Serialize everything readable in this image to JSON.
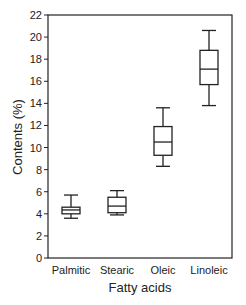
{
  "chart_data": {
    "type": "box",
    "title": "",
    "xlabel": "Fatty acids",
    "ylabel": "Contents (%)",
    "ylim": [
      0,
      22
    ],
    "yticks": [
      0,
      2,
      4,
      6,
      8,
      10,
      12,
      14,
      16,
      18,
      20,
      22
    ],
    "grid": false,
    "legend": null,
    "categories": [
      "Palmitic",
      "Stearic",
      "Oleic",
      "Linoleic"
    ],
    "series": [
      {
        "name": "Palmitic",
        "whisker_low": 3.6,
        "q1": 4.0,
        "median": 4.35,
        "q3": 4.6,
        "whisker_high": 5.7
      },
      {
        "name": "Stearic",
        "whisker_low": 3.9,
        "q1": 4.1,
        "median": 4.7,
        "q3": 5.5,
        "whisker_high": 6.1
      },
      {
        "name": "Oleic",
        "whisker_low": 8.3,
        "q1": 9.3,
        "median": 10.5,
        "q3": 11.9,
        "whisker_high": 13.6
      },
      {
        "name": "Linoleic",
        "whisker_low": 13.8,
        "q1": 15.7,
        "median": 17.1,
        "q3": 18.8,
        "whisker_high": 20.6
      }
    ]
  },
  "colors": {
    "line": "#222222",
    "background": "#ffffff"
  }
}
